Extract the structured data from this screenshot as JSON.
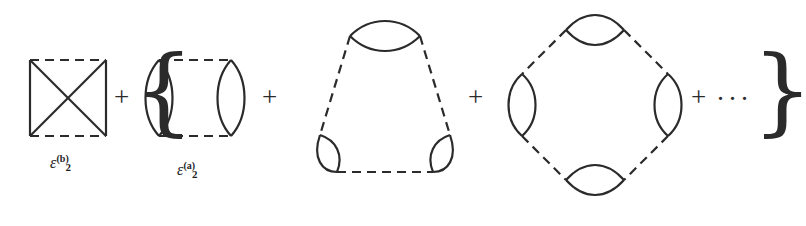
{
  "figure": {
    "kind": "feynman-cluster-diagram-series",
    "background_color": "#ffffff",
    "ink_color": "#2b2b2b"
  },
  "operators": {
    "plus_1": "+",
    "plus_2": "+",
    "plus_3": "+",
    "plus_4": "+",
    "brace_open": "{",
    "brace_close": "}",
    "ellipsis": "···"
  },
  "labels": {
    "epsilon_2b": {
      "symbol": "ε",
      "sub": "2",
      "sup": "(b)",
      "text": "ε₂⁽ᵇ⁾"
    },
    "epsilon_2a": {
      "symbol": "ε",
      "sub": "2",
      "sup": "(a)",
      "text": "ε₂⁽ᵃ⁾"
    }
  },
  "diagrams": [
    {
      "id": "second-order-exchange",
      "name": "square-with-crossed-diagonals",
      "label": "epsilon_2b",
      "vertices": 2,
      "edges": {
        "dashed": 2,
        "solid": 4
      },
      "note": "square: dashed top and bottom interaction lines, solid vertical sides and solid crossing diagonals"
    },
    {
      "id": "second-order-direct",
      "name": "two-bubble-ring",
      "label": "epsilon_2a",
      "vertices": 2,
      "edges": {
        "dashed": 2,
        "solid_bubbles": 2
      },
      "note": "two lens-shaped particle-hole bubbles joined by dashed interaction lines at top and bottom"
    },
    {
      "id": "third-order-ring",
      "name": "triangle-three-bubble-ring",
      "label": null,
      "vertices": 3,
      "edges": {
        "dashed": 3,
        "solid_bubbles": 3
      },
      "note": "triangular ring: three lens bubbles at the vertices joined by three dashed interaction lines"
    },
    {
      "id": "fourth-order-ring",
      "name": "diamond-four-bubble-ring",
      "label": null,
      "vertices": 4,
      "edges": {
        "dashed": 4,
        "solid_bubbles": 4
      },
      "note": "diamond ring: four lens bubbles at top, bottom, left and right vertices joined by four dashed interaction lines"
    }
  ],
  "geometry": {
    "stroke_width": 2.1,
    "dash_pattern": "9 6",
    "square": {
      "x": 28,
      "y": 58,
      "w": 78,
      "h": 78
    },
    "two_bubble": {
      "x": 147,
      "y": 58,
      "w": 96,
      "h": 78
    },
    "triangle": {
      "cx": 385,
      "cy": 105,
      "r": 78
    },
    "diamond": {
      "cx": 590,
      "cy": 105,
      "r": 82
    }
  }
}
